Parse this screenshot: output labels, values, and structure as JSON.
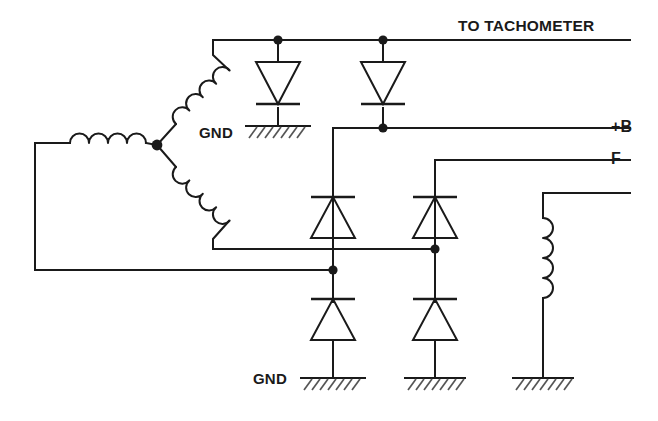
{
  "diagram": {
    "type": "electrical-schematic",
    "background_color": "#ffffff",
    "line_color": "#1a1a1a",
    "hatch_color": "#555555"
  },
  "labels": {
    "tachometer": "TO TACHOMETER",
    "plus_b": "+B",
    "field": "F",
    "negative": "–",
    "gnd_upper": "GND",
    "gnd_lower": "GND"
  },
  "rails": [
    {
      "name": "tachometer-rail",
      "label": "TO TACHOMETER",
      "y": 40
    },
    {
      "name": "plus-b-rail",
      "label": "+B",
      "y": 128
    },
    {
      "name": "field-rail",
      "label": "F",
      "y": 160
    },
    {
      "name": "negative-rail",
      "label": "–",
      "y": 193
    }
  ],
  "components": {
    "stator_coils": [
      {
        "name": "stator-coil-horizontal",
        "orientation": "horizontal",
        "bumps": 4
      },
      {
        "name": "stator-coil-upper-diagonal",
        "orientation": "diagonal",
        "bumps": 4
      },
      {
        "name": "stator-coil-lower-diagonal",
        "orientation": "diagonal",
        "bumps": 4
      }
    ],
    "field_coil": {
      "name": "field-coil",
      "orientation": "vertical",
      "bumps": 4
    },
    "diodes": [
      {
        "name": "diode-top-left",
        "direction": "down",
        "x": 278,
        "y": 85
      },
      {
        "name": "diode-top-right",
        "direction": "down",
        "x": 383,
        "y": 85
      },
      {
        "name": "diode-mid-left",
        "direction": "up",
        "x": 333,
        "y": 215
      },
      {
        "name": "diode-mid-right",
        "direction": "up",
        "x": 435,
        "y": 215
      },
      {
        "name": "diode-bottom-left",
        "direction": "up",
        "x": 333,
        "y": 317
      },
      {
        "name": "diode-bottom-right",
        "direction": "up",
        "x": 435,
        "y": 317
      }
    ],
    "grounds": [
      {
        "name": "ground-upper",
        "x": 278,
        "y": 126,
        "labeled": true
      },
      {
        "name": "ground-bottom-left",
        "x": 333,
        "y": 378,
        "labeled": true
      },
      {
        "name": "ground-bottom-mid",
        "x": 435,
        "y": 378,
        "labeled": false
      },
      {
        "name": "ground-bottom-right",
        "x": 543,
        "y": 378,
        "labeled": false
      }
    ],
    "junctions": [
      {
        "name": "junction-tach-left",
        "x": 278,
        "y": 40
      },
      {
        "name": "junction-tach-right",
        "x": 383,
        "y": 40
      },
      {
        "name": "junction-plus-b",
        "x": 383,
        "y": 128
      },
      {
        "name": "junction-star-point",
        "x": 157,
        "y": 145
      },
      {
        "name": "junction-mid-right",
        "x": 435,
        "y": 249
      },
      {
        "name": "junction-mid-left",
        "x": 333,
        "y": 270
      }
    ]
  }
}
